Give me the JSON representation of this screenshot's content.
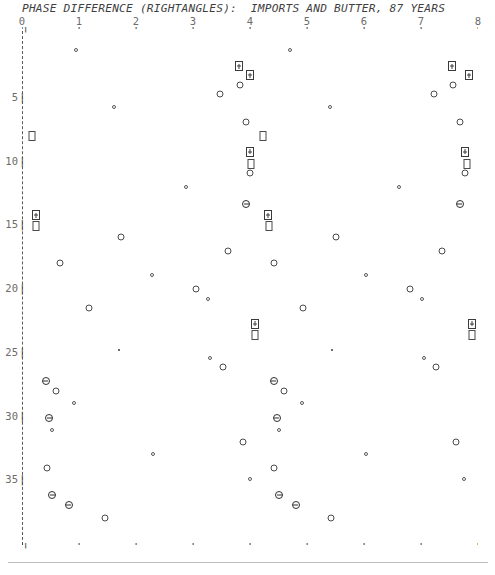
{
  "header": {
    "title": "PHASE DIFFERENCE (RIGHTANGLES):  IMPORTS AND BUTTER, 87 YEARS"
  },
  "axes": {
    "x_tick_labels": [
      "0",
      "1",
      "2",
      "3",
      "4",
      "5",
      "6",
      "7",
      "8"
    ],
    "y_tick_labels": [
      "5",
      "10",
      "15",
      "20",
      "25",
      "30",
      "35"
    ],
    "x_tick_glyph": "+",
    "y_tick_glyph": "|",
    "axis_bracket_glyph": "|"
  },
  "chart_data": {
    "type": "scatter",
    "title": "PHASE DIFFERENCE (RIGHTANGLES):  IMPORTS AND BUTTER, 87 YEARS",
    "xlabel": "",
    "ylabel": "",
    "xlim": [
      0,
      8
    ],
    "ylim": [
      0,
      40
    ],
    "x_ticks": [
      0,
      1,
      2,
      3,
      4,
      5,
      6,
      7,
      8
    ],
    "y_ticks": [
      5,
      10,
      15,
      20,
      25,
      30,
      35
    ],
    "grid": false,
    "legend": "none",
    "y_axis_direction": "downward",
    "marker_kinds": {
      "c-s": "small-open-circle",
      "c-m": "medium-open-circle",
      "c-bar": "circle-with-horizontal-bar",
      "dot": "tiny-filled-dot",
      "sq": "open-rectangle",
      "bplus": "boxed-plus"
    },
    "points": [
      {
        "x": 0.95,
        "y": 1.3,
        "m": "c-s"
      },
      {
        "x": 4.7,
        "y": 1.3,
        "m": "c-s"
      },
      {
        "x": 3.8,
        "y": 2.6,
        "m": "bplus"
      },
      {
        "x": 7.55,
        "y": 2.6,
        "m": "bplus"
      },
      {
        "x": 4.0,
        "y": 3.3,
        "m": "bplus"
      },
      {
        "x": 7.85,
        "y": 3.3,
        "m": "bplus"
      },
      {
        "x": 3.82,
        "y": 4.1,
        "m": "c-m"
      },
      {
        "x": 7.57,
        "y": 4.1,
        "m": "c-m"
      },
      {
        "x": 3.47,
        "y": 4.8,
        "m": "c-m"
      },
      {
        "x": 7.22,
        "y": 4.8,
        "m": "c-m"
      },
      {
        "x": 1.62,
        "y": 5.8,
        "m": "c-s"
      },
      {
        "x": 5.4,
        "y": 5.8,
        "m": "c-s"
      },
      {
        "x": 3.93,
        "y": 7.0,
        "m": "c-m"
      },
      {
        "x": 7.68,
        "y": 7.0,
        "m": "c-m"
      },
      {
        "x": 0.17,
        "y": 8.1,
        "m": "sq"
      },
      {
        "x": 4.23,
        "y": 8.1,
        "m": "sq"
      },
      {
        "x": 4.0,
        "y": 9.3,
        "m": "bplus"
      },
      {
        "x": 7.77,
        "y": 9.3,
        "m": "bplus"
      },
      {
        "x": 4.02,
        "y": 10.3,
        "m": "sq"
      },
      {
        "x": 7.8,
        "y": 10.3,
        "m": "sq"
      },
      {
        "x": 4.0,
        "y": 11.0,
        "m": "c-m"
      },
      {
        "x": 7.78,
        "y": 11.0,
        "m": "c-m"
      },
      {
        "x": 2.88,
        "y": 12.1,
        "m": "c-s"
      },
      {
        "x": 6.62,
        "y": 12.1,
        "m": "c-s"
      },
      {
        "x": 3.93,
        "y": 13.4,
        "m": "c-bar"
      },
      {
        "x": 7.68,
        "y": 13.4,
        "m": "c-bar"
      },
      {
        "x": 0.25,
        "y": 14.3,
        "m": "bplus"
      },
      {
        "x": 4.32,
        "y": 14.3,
        "m": "bplus"
      },
      {
        "x": 0.25,
        "y": 15.1,
        "m": "sq"
      },
      {
        "x": 4.33,
        "y": 15.1,
        "m": "sq"
      },
      {
        "x": 1.74,
        "y": 16.0,
        "m": "c-m"
      },
      {
        "x": 5.51,
        "y": 16.0,
        "m": "c-m"
      },
      {
        "x": 3.62,
        "y": 17.1,
        "m": "c-m"
      },
      {
        "x": 7.37,
        "y": 17.1,
        "m": "c-m"
      },
      {
        "x": 0.67,
        "y": 18.0,
        "m": "c-m"
      },
      {
        "x": 4.42,
        "y": 18.0,
        "m": "c-m"
      },
      {
        "x": 2.28,
        "y": 19.0,
        "m": "c-s"
      },
      {
        "x": 6.03,
        "y": 19.0,
        "m": "c-s"
      },
      {
        "x": 3.06,
        "y": 20.1,
        "m": "c-m"
      },
      {
        "x": 6.8,
        "y": 20.1,
        "m": "c-m"
      },
      {
        "x": 3.27,
        "y": 20.9,
        "m": "c-s"
      },
      {
        "x": 7.02,
        "y": 20.9,
        "m": "c-s"
      },
      {
        "x": 1.18,
        "y": 21.6,
        "m": "c-m"
      },
      {
        "x": 4.93,
        "y": 21.6,
        "m": "c-m"
      },
      {
        "x": 4.08,
        "y": 22.8,
        "m": "bplus"
      },
      {
        "x": 7.9,
        "y": 22.8,
        "m": "bplus"
      },
      {
        "x": 4.08,
        "y": 23.7,
        "m": "sq"
      },
      {
        "x": 7.9,
        "y": 23.7,
        "m": "sq"
      },
      {
        "x": 1.7,
        "y": 24.9,
        "m": "dot"
      },
      {
        "x": 5.44,
        "y": 24.9,
        "m": "dot"
      },
      {
        "x": 3.3,
        "y": 25.5,
        "m": "c-s"
      },
      {
        "x": 7.05,
        "y": 25.5,
        "m": "c-s"
      },
      {
        "x": 3.52,
        "y": 26.2,
        "m": "c-m"
      },
      {
        "x": 7.27,
        "y": 26.2,
        "m": "c-m"
      },
      {
        "x": 0.42,
        "y": 27.3,
        "m": "c-bar"
      },
      {
        "x": 4.42,
        "y": 27.3,
        "m": "c-bar"
      },
      {
        "x": 0.6,
        "y": 28.1,
        "m": "c-m"
      },
      {
        "x": 4.6,
        "y": 28.1,
        "m": "c-m"
      },
      {
        "x": 0.92,
        "y": 29.0,
        "m": "c-s"
      },
      {
        "x": 4.91,
        "y": 29.0,
        "m": "c-s"
      },
      {
        "x": 0.48,
        "y": 30.2,
        "m": "c-bar"
      },
      {
        "x": 4.47,
        "y": 30.2,
        "m": "c-bar"
      },
      {
        "x": 0.52,
        "y": 31.1,
        "m": "c-s"
      },
      {
        "x": 4.51,
        "y": 31.1,
        "m": "c-s"
      },
      {
        "x": 3.87,
        "y": 32.1,
        "m": "c-m"
      },
      {
        "x": 7.62,
        "y": 32.1,
        "m": "c-m"
      },
      {
        "x": 2.29,
        "y": 33.0,
        "m": "c-s"
      },
      {
        "x": 6.04,
        "y": 33.0,
        "m": "c-s"
      },
      {
        "x": 0.43,
        "y": 34.1,
        "m": "c-m"
      },
      {
        "x": 4.42,
        "y": 34.1,
        "m": "c-m"
      },
      {
        "x": 4.0,
        "y": 35.0,
        "m": "c-s"
      },
      {
        "x": 7.76,
        "y": 35.0,
        "m": "c-s"
      },
      {
        "x": 0.53,
        "y": 36.2,
        "m": "c-bar"
      },
      {
        "x": 4.51,
        "y": 36.2,
        "m": "c-bar"
      },
      {
        "x": 0.82,
        "y": 37.0,
        "m": "c-bar"
      },
      {
        "x": 4.8,
        "y": 37.0,
        "m": "c-bar"
      },
      {
        "x": 1.45,
        "y": 38.0,
        "m": "c-m"
      },
      {
        "x": 5.42,
        "y": 38.0,
        "m": "c-m"
      }
    ]
  }
}
